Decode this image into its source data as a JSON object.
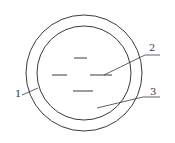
{
  "diagram": {
    "stroke_color": "#3a3a3a",
    "background": "#ffffff",
    "outer_circle": {
      "cx": 84,
      "cy": 73,
      "r": 58
    },
    "inner_circle": {
      "cx": 84,
      "cy": 73,
      "r": 47
    },
    "dashes": [
      {
        "x1": 74,
        "y1": 58,
        "x2": 87,
        "y2": 58
      },
      {
        "x1": 52,
        "y1": 75,
        "x2": 67,
        "y2": 75
      },
      {
        "x1": 90,
        "y1": 75,
        "x2": 112,
        "y2": 75
      },
      {
        "x1": 73,
        "y1": 91,
        "x2": 93,
        "y2": 91
      }
    ],
    "labels": [
      {
        "id": "1",
        "text": "1",
        "x": 16,
        "y": 88
      },
      {
        "id": "2",
        "text": "2",
        "x": 149,
        "y": 42
      },
      {
        "id": "3",
        "text": "3",
        "x": 150,
        "y": 86
      }
    ],
    "leaders": [
      {
        "label": "1",
        "points": [
          [
            22,
            95
          ],
          [
            38,
            88
          ]
        ]
      },
      {
        "label": "2",
        "points": [
          [
            160,
            55
          ],
          [
            145,
            55
          ],
          [
            104,
            75
          ]
        ]
      },
      {
        "label": "3",
        "points": [
          [
            160,
            97
          ],
          [
            143,
            97
          ],
          [
            97,
            108
          ]
        ]
      }
    ]
  }
}
